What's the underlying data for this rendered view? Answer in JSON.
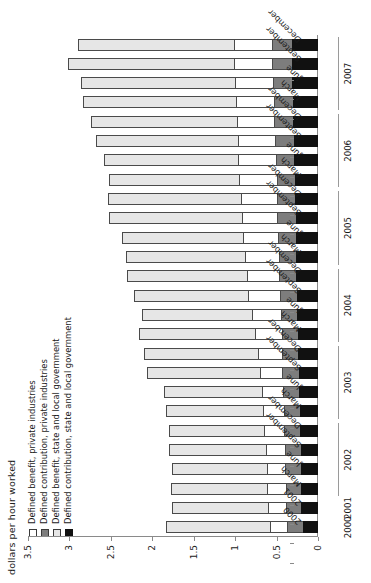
{
  "chart_data": {
    "type": "bar",
    "subtype": "stacked-horizontal",
    "title": "",
    "xlabel": "",
    "ylabel": "dollars per hour worked",
    "ylim": [
      0,
      3.5
    ],
    "yticks": [
      0,
      0.5,
      1,
      1.5,
      2,
      2.5,
      3,
      3.5
    ],
    "ytick_labels": [
      "0",
      "0.5",
      "1",
      "1.5",
      "2",
      "2.5",
      "3",
      "3.5"
    ],
    "grid": false,
    "legend_position": "top-left",
    "orientation": "rotated-90-ccw",
    "categories": [
      "2000",
      "2001",
      "March",
      "June",
      "September",
      "December",
      "March",
      "June",
      "September",
      "December",
      "March",
      "June",
      "September",
      "December",
      "March",
      "June",
      "September",
      "December",
      "March",
      "June",
      "September",
      "December",
      "March",
      "June",
      "September",
      "December"
    ],
    "year_groups": [
      {
        "label": "2000",
        "start": 0,
        "end": 0
      },
      {
        "label": "2001",
        "start": 1,
        "end": 1
      },
      {
        "label": "2002",
        "start": 2,
        "end": 5
      },
      {
        "label": "2003",
        "start": 6,
        "end": 9
      },
      {
        "label": "2004",
        "start": 10,
        "end": 13
      },
      {
        "label": "2005",
        "start": 14,
        "end": 17
      },
      {
        "label": "2006",
        "start": 18,
        "end": 21
      },
      {
        "label": "2007",
        "start": 22,
        "end": 25
      }
    ],
    "series": [
      {
        "name": "Defined contribution, state and local government",
        "color": "#111111",
        "values": [
          0.18,
          0.2,
          0.2,
          0.21,
          0.21,
          0.22,
          0.22,
          0.23,
          0.23,
          0.24,
          0.24,
          0.25,
          0.25,
          0.26,
          0.26,
          0.27,
          0.27,
          0.28,
          0.28,
          0.29,
          0.29,
          0.3,
          0.3,
          0.31,
          0.31,
          0.32
        ]
      },
      {
        "name": "Defined contribution, private industries",
        "color": "#7d7d7d",
        "values": [
          0.38,
          0.39,
          0.39,
          0.4,
          0.4,
          0.41,
          0.41,
          0.42,
          0.43,
          0.44,
          0.44,
          0.45,
          0.46,
          0.47,
          0.47,
          0.48,
          0.49,
          0.5,
          0.5,
          0.51,
          0.52,
          0.53,
          0.53,
          0.54,
          0.55,
          0.56
        ]
      },
      {
        "name": "Defined benefit, private industries",
        "color": "#ffffff",
        "values": [
          0.58,
          0.6,
          0.61,
          0.62,
          0.63,
          0.65,
          0.66,
          0.68,
          0.7,
          0.72,
          0.76,
          0.8,
          0.84,
          0.86,
          0.88,
          0.9,
          0.92,
          0.93,
          0.95,
          0.96,
          0.97,
          0.98,
          0.99,
          1.0,
          1.01,
          1.02
        ]
      },
      {
        "name": "Defined benefit, state and local government",
        "color": "#e6e6e6",
        "values": [
          1.84,
          1.76,
          1.78,
          1.76,
          1.8,
          1.8,
          1.84,
          1.86,
          2.06,
          2.1,
          2.16,
          2.12,
          2.22,
          2.3,
          2.32,
          2.36,
          2.52,
          2.54,
          2.52,
          2.58,
          2.68,
          2.74,
          2.84,
          2.86,
          3.02,
          2.9
        ]
      }
    ],
    "totals": [
      1.84,
      1.76,
      1.78,
      1.76,
      1.8,
      1.8,
      1.84,
      1.86,
      2.06,
      2.1,
      2.16,
      2.12,
      2.22,
      2.3,
      2.32,
      2.36,
      2.52,
      2.54,
      2.52,
      2.58,
      2.68,
      2.74,
      2.84,
      2.86,
      3.02,
      2.9
    ]
  },
  "axis": {
    "title": "dollars per hour worked"
  },
  "legend": {
    "items": [
      {
        "label": "Defined benefit, private industries",
        "swatch": "#ffffff"
      },
      {
        "label": "Defined contribution, private industries",
        "swatch": "#7d7d7d"
      },
      {
        "label": "Defined benefit, state and local government",
        "swatch": "#e6e6e6"
      },
      {
        "label": "Defined contribution, state and local government",
        "swatch": "#111111"
      }
    ]
  }
}
